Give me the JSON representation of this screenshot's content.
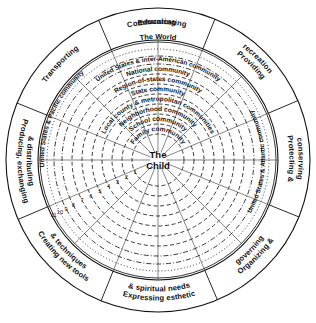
{
  "diagram": {
    "type": "concentric-circles",
    "center": {
      "line1": "The",
      "line2": "Child",
      "label": "The Child"
    },
    "geometry": {
      "cx": 158,
      "cy": 160,
      "outer_radius": 152,
      "band_inner_radius": 120,
      "world_ring_radius": 118
    },
    "outer_band": {
      "name": "social-functions-band",
      "sector_count": 8,
      "sectors": [
        {
          "id": "educating",
          "label": "Educating",
          "start_deg": -113,
          "end_deg": -68,
          "text_radius": 136
        },
        {
          "id": "providing-recreation",
          "label": "Providing recreation",
          "start_deg": -68,
          "end_deg": -23,
          "text_radius": 136,
          "lines": [
            "Providing",
            "recreation"
          ]
        },
        {
          "id": "protecting-conserving",
          "label": "Protecting & conserving",
          "start_deg": -23,
          "end_deg": 22,
          "text_radius": 136,
          "lines": [
            "Protecting &",
            "conserving"
          ]
        },
        {
          "id": "organizing-governing",
          "label": "Organizing & governing",
          "start_deg": 22,
          "end_deg": 67,
          "text_radius": 136,
          "lines": [
            "Organizing &",
            "governing"
          ]
        },
        {
          "id": "expressing-esthetic-spiritual-needs",
          "label": "Expressing esthetic & spiritual needs",
          "start_deg": 67,
          "end_deg": 112,
          "text_radius": 136,
          "lines": [
            "Expressing esthetic",
            "& spiritual needs"
          ]
        },
        {
          "id": "creating-new-tools-techniques",
          "label": "Creating new tools & techniques",
          "start_deg": 112,
          "end_deg": 157,
          "text_radius": 136,
          "lines": [
            "Creating new tools",
            "& techniques"
          ]
        },
        {
          "id": "producing-exchanging-distributing",
          "label": "Producing, exchanging & distributing",
          "start_deg": 157,
          "end_deg": 202,
          "text_radius": 136,
          "lines": [
            "Producing, exchanging",
            "& distributing"
          ]
        },
        {
          "id": "transporting",
          "label": "Transporting",
          "start_deg": 202,
          "end_deg": 247,
          "text_radius": 136
        },
        {
          "id": "communicating",
          "label": "Communicating",
          "start_deg": 247,
          "end_deg": 292,
          "text_radius": 136
        }
      ]
    },
    "community_rings": [
      {
        "index": 1,
        "label": "Family community",
        "radius": 26,
        "style": "dashed"
      },
      {
        "index": 2,
        "label": "School community",
        "radius": 36,
        "style": "dashed"
      },
      {
        "index": 3,
        "label": "Neighborhood community",
        "radius": 46,
        "style": "dashed"
      },
      {
        "index": 4,
        "label": "Local county & metropolitan communities",
        "radius": 56,
        "style": "dashed"
      },
      {
        "index": 5,
        "label": "State community",
        "radius": 66,
        "style": "dashed"
      },
      {
        "index": 6,
        "label": "Region-of-states community",
        "radius": 76,
        "style": "dashed"
      },
      {
        "index": 7,
        "label": "National community",
        "radius": 86,
        "style": "dashed"
      },
      {
        "index": 8,
        "label": "United States & inter-American community",
        "radius": 96,
        "style": "dash-dot"
      },
      {
        "index": 9,
        "label": "United States & Atlantic community",
        "radius": 104,
        "style": "dash-dot"
      },
      {
        "index": 10,
        "label": "United States & Pacific community",
        "radius": 111,
        "style": "dotted"
      },
      {
        "index": 11,
        "label": "The World",
        "radius": 118,
        "style": "solid"
      }
    ],
    "ring_numbers": [
      "1",
      "2",
      "3",
      "4",
      "5",
      "6",
      "7",
      "8",
      "9",
      "10",
      "11"
    ],
    "ring_number_angle_deg": 152,
    "colors": {
      "ink": "#111111",
      "background": "#ffffff",
      "rings": "#222222"
    }
  }
}
